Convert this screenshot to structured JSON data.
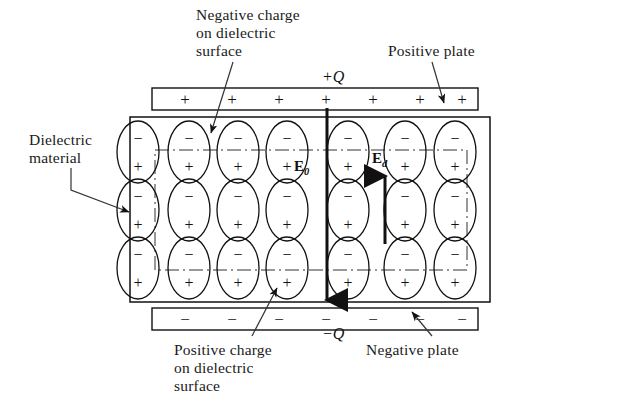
{
  "figure": {
    "background_color": "#ffffff",
    "ink_color": "#111111"
  },
  "labels": {
    "negative_charge": "Negative charge\non dielectric\nsurface",
    "positive_plate": "Positive plate",
    "dielectric_material": "Dielectric\nmaterial",
    "positive_charge": "Positive charge\non dielectric\nsurface",
    "negative_plate": "Negative plate"
  },
  "charges": {
    "top_plate_charge": "+Q",
    "bottom_plate_charge": "−Q"
  },
  "fields": {
    "applied_field": "E",
    "applied_field_subscript": "0",
    "applied_field_full": "E0",
    "applied_field_direction": "down",
    "dielectric_field": "E",
    "dielectric_field_subscript": "d",
    "dielectric_field_full": "Ed",
    "dielectric_field_direction": "up"
  },
  "plates": {
    "top": {
      "name": "positive-plate",
      "sign": "+",
      "count": 7,
      "signs": [
        "+",
        "+",
        "+",
        "+",
        "+",
        "+",
        "+"
      ]
    },
    "bottom": {
      "name": "negative-plate",
      "sign": "−",
      "count": 7,
      "signs": [
        "−",
        "−",
        "−",
        "−",
        "−",
        "−",
        "−"
      ]
    }
  },
  "dipoles": {
    "rows": 3,
    "columns": 7,
    "top_sign": "−",
    "bottom_sign": "+",
    "description": "vertical ellipse dipoles, minus on top, plus on bottom"
  }
}
